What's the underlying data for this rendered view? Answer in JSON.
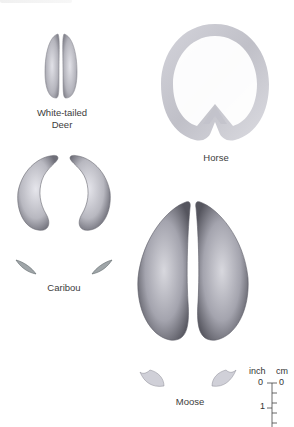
{
  "tracks": [
    {
      "id": "white-tailed-deer",
      "label_line1": "White-tailed",
      "label_line2": "Deer"
    },
    {
      "id": "horse",
      "label": "Horse"
    },
    {
      "id": "caribou",
      "label": "Caribou"
    },
    {
      "id": "moose",
      "label": "Moose"
    }
  ],
  "scale": {
    "unit_left": "inch",
    "unit_right": "cm",
    "inch_ticks": [
      "0",
      "1"
    ],
    "cm_ticks": [
      "0"
    ]
  },
  "colors": {
    "print_dark": "#5a5a62",
    "print_mid": "#a8a8b0",
    "print_light": "#e4e4ea",
    "text": "#3c3c3c"
  }
}
